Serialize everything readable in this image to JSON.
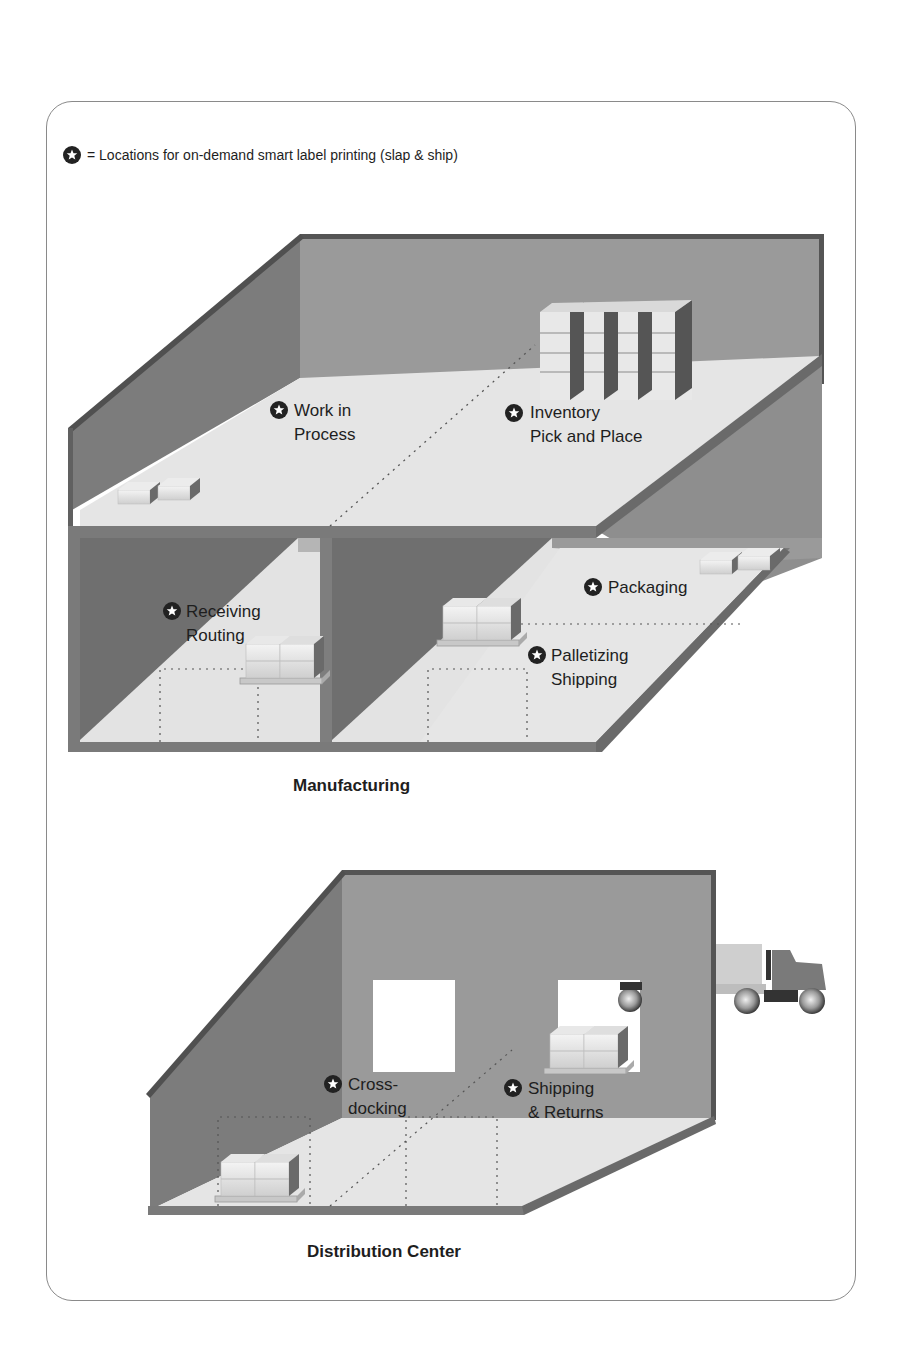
{
  "legend": {
    "icon": "star-badge-icon",
    "text": "= Locations for on-demand smart label printing (slap & ship)"
  },
  "manufacturing": {
    "title": "Manufacturing",
    "locations": [
      {
        "line1": "Work in",
        "line2": "Process"
      },
      {
        "line1": "Inventory",
        "line2": "Pick and Place"
      },
      {
        "line1": "Receiving",
        "line2": "Routing"
      },
      {
        "line1": "Packaging",
        "line2": ""
      },
      {
        "line1": "Palletizing",
        "line2": "Shipping"
      }
    ]
  },
  "distribution_center": {
    "title": "Distribution Center",
    "locations": [
      {
        "line1": "Cross-",
        "line2": "docking"
      },
      {
        "line1": "Shipping",
        "line2": "& Returns"
      }
    ]
  },
  "colors": {
    "wall_dark": "#6e6e6e",
    "wall_mid": "#8c8c8c",
    "wall_back": "#9a9a9a",
    "floor": "#e4e4e4",
    "edge": "#4a4a4a",
    "icon": "#222222"
  }
}
